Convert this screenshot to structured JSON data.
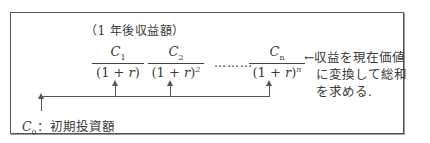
{
  "diagram": {
    "top_label": "（1 年後収益額）",
    "fractions": [
      {
        "numerator": "C",
        "numerator_sub": "1",
        "denominator": "(1 + r)",
        "exponent": ""
      },
      {
        "numerator": "C",
        "numerator_sub": "2",
        "denominator": "(1 + r)",
        "exponent": "2"
      },
      {
        "numerator": "C",
        "numerator_sub": "n",
        "denominator": "(1 + r)",
        "exponent": "n"
      }
    ],
    "ellipsis": "………",
    "note_lines": [
      "←収益を現在価値",
      "に変換して総和",
      "を求める."
    ],
    "initial": {
      "symbol": "C",
      "sub": "0",
      "label": "：初期投資額"
    }
  }
}
